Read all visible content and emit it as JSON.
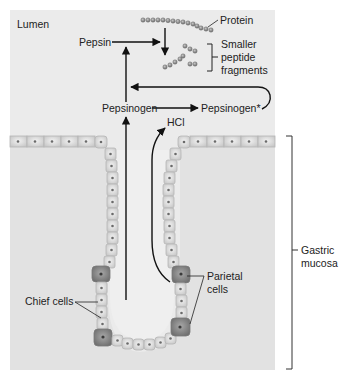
{
  "diagram": {
    "labels": {
      "lumen": "Lumen",
      "protein": "Protein",
      "pepsin": "Pepsin",
      "fragments_line1": "Smaller",
      "fragments_line2": "peptide",
      "fragments_line3": "fragments",
      "pepsinogen": "Pepsinogen",
      "pepsinogen_star": "Pepsinogen*",
      "hcl": "HCl",
      "gastric_line1": "Gastric",
      "gastric_line2": "mucosa",
      "chief_cells": "Chief cells",
      "parietal_line1": "Parietal",
      "parietal_line2": "cells"
    },
    "colors": {
      "panel": "#e9e9e9",
      "cell_fill": "#d8d8d8",
      "cell_stroke": "#b9b9b9",
      "dark_cell": "#8d8d8d",
      "arrow": "#111111",
      "bead": "#8a8a8a"
    }
  }
}
